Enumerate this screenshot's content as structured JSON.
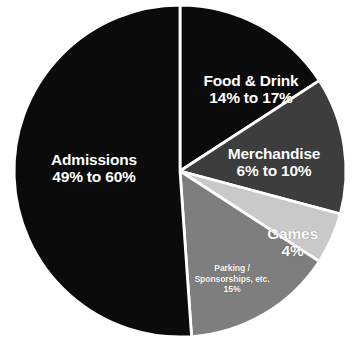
{
  "chart_data": {
    "type": "pie",
    "title": "",
    "subtitle": "",
    "xlabel": "",
    "ylabel": "",
    "legend_position": "none",
    "grid": false,
    "labels_inside_slices": true,
    "start_angle_deg": 0,
    "direction": "clockwise",
    "categories": [
      "Food & Drink",
      "Merchandise",
      "Games",
      "Parking / Sponsorships, etc.",
      "Admissions"
    ],
    "values": [
      15.5,
      8,
      4,
      15,
      54.5
    ],
    "value_labels": [
      "14% to 17%",
      "6% to 10%",
      "4%",
      "15%",
      "49% to 60%"
    ],
    "colors": [
      "#0b0b0b",
      "#3d3d3d",
      "#c9c9c9",
      "#7e7e7e",
      "#0b0b0b"
    ],
    "slices": [
      {
        "name": "Food & Drink",
        "value_label": "14% to 17%",
        "range_low_pct": 14,
        "range_high_pct": 17,
        "share_pct": 15.5,
        "color": "#0b0b0b",
        "start_angle_deg": 0,
        "end_angle_deg": 57
      },
      {
        "name": "Merchandise",
        "value_label": "6% to 10%",
        "range_low_pct": 6,
        "range_high_pct": 10,
        "share_pct": 8,
        "color": "#3d3d3d",
        "start_angle_deg": 57,
        "end_angle_deg": 105
      },
      {
        "name": "Games",
        "value_label": "4%",
        "range_low_pct": 4,
        "range_high_pct": 4,
        "share_pct": 4,
        "color": "#c9c9c9",
        "start_angle_deg": 105,
        "end_angle_deg": 123
      },
      {
        "name": "Parking / Sponsorships, etc.",
        "value_label": "15%",
        "range_low_pct": 15,
        "range_high_pct": 15,
        "share_pct": 15,
        "color": "#7e7e7e",
        "start_angle_deg": 123,
        "end_angle_deg": 176
      },
      {
        "name": "Admissions",
        "value_label": "49% to 60%",
        "range_low_pct": 49,
        "range_high_pct": 60,
        "share_pct": 54.5,
        "color": "#0b0b0b",
        "start_angle_deg": 176,
        "end_angle_deg": 360
      }
    ]
  },
  "labels": {
    "admissions": {
      "name": "Admissions",
      "value": "49% to 60%"
    },
    "food_drink": {
      "name": "Food & Drink",
      "value": "14% to 17%"
    },
    "merchandise": {
      "name": "Merchandise",
      "value": "6% to 10%"
    },
    "games": {
      "name": "Games",
      "value": "4%"
    },
    "parking": {
      "name_line1": "Parking /",
      "name_line2": "Sponsorships, etc.",
      "value": "15%"
    }
  },
  "style": {
    "background": "#ffffff",
    "slice_border": "#ffffff",
    "label_text_color": "#ffffff"
  }
}
